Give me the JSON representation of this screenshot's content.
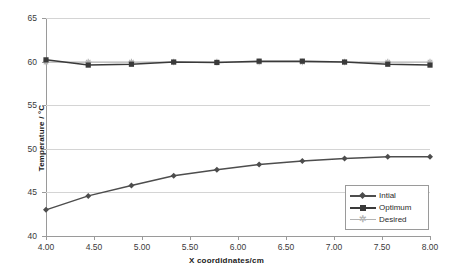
{
  "chart_data": {
    "type": "line",
    "title": "",
    "xlabel": "X coordidnates/cm",
    "ylabel": "Temperature / °C",
    "x": [
      4.0,
      4.44,
      4.89,
      5.33,
      5.78,
      6.22,
      6.67,
      7.11,
      7.56,
      8.0
    ],
    "xlim": [
      4.0,
      8.0
    ],
    "ylim": [
      40,
      65
    ],
    "xticks": [
      "4.00",
      "4.50",
      "5.00",
      "5.50",
      "6.00",
      "6.50",
      "7.00",
      "7.50",
      "8.00"
    ],
    "xtick_values": [
      4.0,
      4.5,
      5.0,
      5.5,
      6.0,
      6.5,
      7.0,
      7.5,
      8.0
    ],
    "yticks": [
      "40",
      "45",
      "50",
      "55",
      "60",
      "65"
    ],
    "ytick_values": [
      40,
      45,
      50,
      55,
      60,
      65
    ],
    "grid": "horizontal",
    "legend_position": "lower-right-inside",
    "series": [
      {
        "name": "Intial",
        "marker": "diamond",
        "color": "#4d4d4d",
        "values": [
          43.0,
          44.6,
          45.8,
          46.9,
          47.6,
          48.2,
          48.6,
          48.9,
          49.1,
          49.1
        ]
      },
      {
        "name": "Optimum",
        "marker": "square",
        "color": "#3a3a3a",
        "values": [
          60.2,
          59.6,
          59.7,
          59.95,
          59.9,
          60.05,
          60.05,
          59.95,
          59.7,
          59.6
        ]
      },
      {
        "name": "Desired",
        "marker": "asterisk",
        "color": "#b3b3b3",
        "values": [
          59.95,
          59.95,
          59.95,
          59.95,
          59.95,
          59.95,
          59.95,
          59.95,
          59.95,
          59.95
        ]
      }
    ]
  },
  "legend": {
    "items": [
      {
        "label": "Intial"
      },
      {
        "label": "Optimum"
      },
      {
        "label": "Desired"
      }
    ]
  },
  "axes": {
    "y_title": "Temperature / °C",
    "x_title": "X coordidnates/cm"
  }
}
